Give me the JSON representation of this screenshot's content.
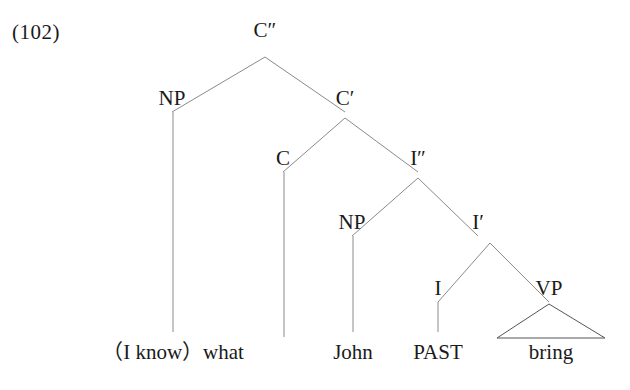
{
  "example": {
    "number": "(102)"
  },
  "tree": {
    "nodes": [
      {
        "id": "cmax",
        "label": "C″",
        "x": 265,
        "y": 30
      },
      {
        "id": "np1",
        "label": "NP",
        "x": 172,
        "y": 98
      },
      {
        "id": "cbar",
        "label": "C′",
        "x": 345,
        "y": 98
      },
      {
        "id": "c",
        "label": "C",
        "x": 283,
        "y": 158
      },
      {
        "id": "imax",
        "label": "I″",
        "x": 418,
        "y": 158
      },
      {
        "id": "np2",
        "label": "NP",
        "x": 352,
        "y": 222
      },
      {
        "id": "ibar",
        "label": "I′",
        "x": 478,
        "y": 222
      },
      {
        "id": "i",
        "label": "I",
        "x": 438,
        "y": 288
      },
      {
        "id": "vp",
        "label": "VP",
        "x": 549,
        "y": 288
      }
    ],
    "terminals": [
      {
        "id": "what",
        "label": "（I know）what",
        "x": 173,
        "y": 342,
        "align": "center"
      },
      {
        "id": "john",
        "label": "John",
        "x": 353,
        "y": 342,
        "align": "center"
      },
      {
        "id": "past",
        "label": "PAST",
        "x": 438,
        "y": 342,
        "align": "center"
      },
      {
        "id": "bring",
        "label": "bring",
        "x": 551,
        "y": 342,
        "align": "center"
      }
    ],
    "edges": [
      {
        "from": "cmax",
        "to": "np1",
        "type": "branch"
      },
      {
        "from": "cmax",
        "to": "cbar",
        "type": "branch"
      },
      {
        "from": "cbar",
        "to": "c",
        "type": "branch"
      },
      {
        "from": "cbar",
        "to": "imax",
        "type": "branch"
      },
      {
        "from": "imax",
        "to": "np2",
        "type": "branch"
      },
      {
        "from": "imax",
        "to": "ibar",
        "type": "branch"
      },
      {
        "from": "ibar",
        "to": "i",
        "type": "branch"
      },
      {
        "from": "ibar",
        "to": "vp",
        "type": "branch"
      },
      {
        "from": "np1",
        "to": "what",
        "type": "stem"
      },
      {
        "from": "c",
        "to": "empty",
        "type": "stem"
      },
      {
        "from": "np2",
        "to": "john",
        "type": "stem"
      },
      {
        "from": "i",
        "to": "past",
        "type": "stem"
      },
      {
        "from": "vp",
        "to": "bring",
        "type": "triangle"
      }
    ],
    "style": {
      "line_color": "#8a8a8a",
      "line_width": 1,
      "text_color": "#1a1a1a",
      "background": "#ffffff"
    }
  }
}
